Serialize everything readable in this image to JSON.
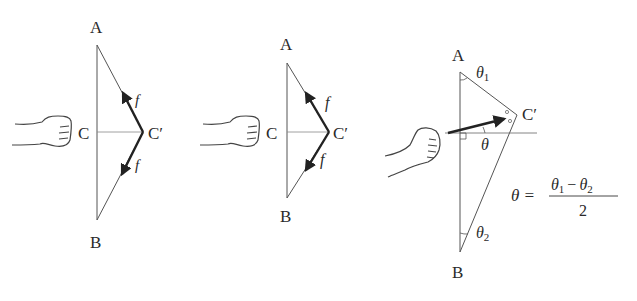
{
  "diagrams": [
    {
      "id": "panel-1",
      "labels": {
        "A": "A",
        "B": "B",
        "C": "C",
        "Cp": "C′",
        "f_top": "f",
        "f_bottom": "f"
      }
    },
    {
      "id": "panel-2",
      "labels": {
        "A": "A",
        "B": "B",
        "C": "C",
        "Cp": "C′",
        "f_top": "f",
        "f_bottom": "f"
      }
    },
    {
      "id": "panel-3",
      "labels": {
        "A": "A",
        "B": "B",
        "Cp": "C′",
        "theta1": "θ",
        "theta1_sub": "1",
        "theta2": "θ",
        "theta2_sub": "2",
        "theta": "θ"
      },
      "formula": {
        "lhs": "θ =",
        "num_a": "θ",
        "num_a_sub": "1",
        "minus": "−",
        "num_b": "θ",
        "num_b_sub": "2",
        "den": "2"
      }
    }
  ],
  "colors": {
    "line": "#555555",
    "arrow": "#222222",
    "text": "#2a2a2a"
  }
}
